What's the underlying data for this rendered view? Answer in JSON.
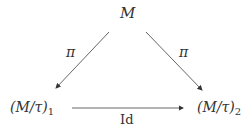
{
  "diagram": {
    "type": "commutative-triangle",
    "nodes": {
      "top": {
        "label": "M"
      },
      "left": {
        "prefix": "(M/τ)",
        "sub": "1"
      },
      "right": {
        "prefix": "(M/τ)",
        "sub": "2"
      }
    },
    "edges": [
      {
        "from": "top",
        "to": "left",
        "label": "π"
      },
      {
        "from": "top",
        "to": "right",
        "label": "π"
      },
      {
        "from": "left",
        "to": "right",
        "label": "Id"
      }
    ]
  }
}
